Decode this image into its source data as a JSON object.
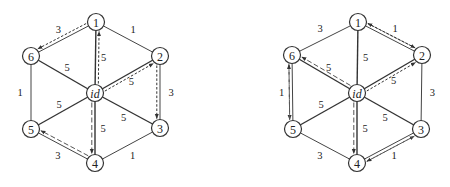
{
  "graphs": [
    {
      "name": "left",
      "nodes": [
        {
          "id": "1",
          "label": "1",
          "x": 96,
          "y": 22
        },
        {
          "id": "2",
          "label": "2",
          "x": 160,
          "y": 56
        },
        {
          "id": "3",
          "label": "3",
          "x": 160,
          "y": 128
        },
        {
          "id": "4",
          "label": "4",
          "x": 95,
          "y": 163
        },
        {
          "id": "5",
          "label": "5",
          "x": 31,
          "y": 129
        },
        {
          "id": "6",
          "label": "6",
          "x": 31,
          "y": 56
        },
        {
          "id": "id",
          "label": "id",
          "x": 95,
          "y": 93
        }
      ],
      "edges": [
        {
          "from": "1",
          "to": "2",
          "weight": "1"
        },
        {
          "from": "2",
          "to": "3",
          "weight": "3"
        },
        {
          "from": "3",
          "to": "4",
          "weight": "1"
        },
        {
          "from": "4",
          "to": "5",
          "weight": "3"
        },
        {
          "from": "5",
          "to": "6",
          "weight": "1"
        },
        {
          "from": "6",
          "to": "1",
          "weight": "3"
        },
        {
          "from": "id",
          "to": "1",
          "weight": "5"
        },
        {
          "from": "id",
          "to": "2",
          "weight": "5"
        },
        {
          "from": "id",
          "to": "3",
          "weight": "5"
        },
        {
          "from": "id",
          "to": "4",
          "weight": "5"
        },
        {
          "from": "id",
          "to": "5",
          "weight": "5"
        },
        {
          "from": "id",
          "to": "6",
          "weight": "5"
        }
      ],
      "paths": [
        {
          "style": "dotted",
          "from": "id",
          "to": "1"
        },
        {
          "style": "dotted",
          "from": "1",
          "to": "6"
        },
        {
          "style": "dotted",
          "from": "id",
          "to": "2"
        },
        {
          "style": "dotted",
          "from": "2",
          "to": "3"
        },
        {
          "style": "dashed",
          "from": "id",
          "to": "4"
        },
        {
          "style": "dashed",
          "from": "4",
          "to": "5"
        }
      ]
    },
    {
      "name": "right",
      "nodes": [
        {
          "id": "1",
          "label": "1",
          "x": 358,
          "y": 22
        },
        {
          "id": "2",
          "label": "2",
          "x": 422,
          "y": 55
        },
        {
          "id": "3",
          "label": "3",
          "x": 421,
          "y": 129
        },
        {
          "id": "4",
          "label": "4",
          "x": 357,
          "y": 163
        },
        {
          "id": "5",
          "label": "5",
          "x": 293,
          "y": 129
        },
        {
          "id": "6",
          "label": "6",
          "x": 292,
          "y": 55
        },
        {
          "id": "id",
          "label": "id",
          "x": 357,
          "y": 93
        }
      ],
      "edges": [
        {
          "from": "1",
          "to": "2",
          "weight": "1"
        },
        {
          "from": "2",
          "to": "3",
          "weight": "3"
        },
        {
          "from": "3",
          "to": "4",
          "weight": "1"
        },
        {
          "from": "4",
          "to": "5",
          "weight": "3"
        },
        {
          "from": "5",
          "to": "6",
          "weight": "1"
        },
        {
          "from": "6",
          "to": "1",
          "weight": "3"
        },
        {
          "from": "id",
          "to": "1",
          "weight": "5"
        },
        {
          "from": "id",
          "to": "2",
          "weight": "5"
        },
        {
          "from": "id",
          "to": "3",
          "weight": "5"
        },
        {
          "from": "id",
          "to": "4",
          "weight": "5"
        },
        {
          "from": "id",
          "to": "5",
          "weight": "5"
        },
        {
          "from": "id",
          "to": "6",
          "weight": "5"
        }
      ],
      "paths": [
        {
          "style": "dotted",
          "from": "id",
          "to": "2"
        },
        {
          "style": "dotted",
          "from": "2",
          "to": "1"
        },
        {
          "style": "dotted",
          "from": "1",
          "to": "2"
        },
        {
          "style": "dashed",
          "from": "id",
          "to": "6"
        },
        {
          "style": "dashed",
          "from": "6",
          "to": "5"
        },
        {
          "style": "dashed",
          "from": "5",
          "to": "6"
        },
        {
          "style": "dashed",
          "from": "id",
          "to": "4"
        },
        {
          "style": "dashed",
          "from": "4",
          "to": "3"
        },
        {
          "style": "dashed",
          "from": "3",
          "to": "4"
        }
      ]
    }
  ]
}
